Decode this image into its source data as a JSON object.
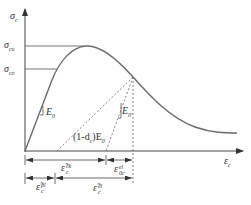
{
  "diagram": {
    "title": "",
    "type": "concrete compressive stress-strain curve with damage unloading",
    "axes": {
      "y_label": {
        "symbol": "σ",
        "sub": "c"
      },
      "x_label": {
        "symbol": "ε",
        "sub": "c"
      }
    },
    "stress_levels": [
      {
        "symbol": "σ",
        "sub": "cu",
        "name": "peak stress"
      },
      {
        "symbol": "σ",
        "sub": "co",
        "name": "elastic limit stress"
      }
    ],
    "slopes": [
      {
        "symbol": "E",
        "sub": "0",
        "name": "initial elastic modulus"
      },
      {
        "symbol": "E",
        "sub": "0'",
        "name": "reference modulus"
      },
      {
        "prefix": "(1-d",
        "prefix_sub": "c",
        "suffix": ")E",
        "suffix_sub": "0",
        "name": "damaged modulus"
      }
    ],
    "strain_dimensions": {
      "row1": [
        {
          "symbol": "ε̃",
          "sup": "ck",
          "sub": "c"
        },
        {
          "symbol": "ε",
          "sup": "el",
          "sub": "0c"
        }
      ],
      "row2": [
        {
          "symbol": "ε̃",
          "sup": "pl",
          "sub": "c"
        },
        {
          "symbol": "ε̃",
          "sup": "el",
          "sub": "c"
        }
      ]
    },
    "colors": {
      "curve": "#6a6a6a",
      "axis": "#444444",
      "dashed": "#666666",
      "text": "#333333"
    }
  }
}
